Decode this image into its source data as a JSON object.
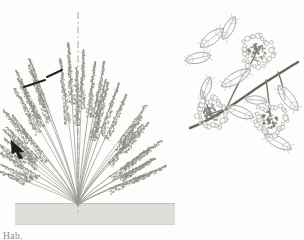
{
  "plate": {
    "background_color": "#fdfdfc",
    "ink_color": "#8a8a86",
    "dark_ink_color": "#23231f",
    "line_color": "#9b9b95",
    "soil_color": "#d8d8d2",
    "caption": "Hab."
  },
  "habit_panel": {
    "name": "plant-habit-illustration",
    "description": "Whole-plant habit drawing of a low shrub with many arching stems bearing dense flowering spikes, rooted at a central crown in a soil band.",
    "axis_line": {
      "label": "vertical-dashed-axis",
      "style": "dash-dot",
      "x": 78,
      "y_top": 12,
      "y_bottom": 214
    },
    "crown": {
      "x": 78,
      "y": 205
    },
    "soil_band": {
      "label": "soil-ground-band",
      "x": 15,
      "y": 203,
      "width": 160,
      "height": 22,
      "fill": "#d8d8d2"
    },
    "markers": [
      {
        "label": "scale-bar-upper",
        "x1": 47,
        "y1": 77,
        "x2": 62,
        "y2": 70
      },
      {
        "label": "scale-bar-lower",
        "x1": 24,
        "y1": 87,
        "x2": 45,
        "y2": 80
      },
      {
        "label": "arrow-pointer",
        "x": 17,
        "y": 146
      }
    ],
    "stem_count": 34,
    "spike_count": 34
  },
  "detail_panel": {
    "name": "flowering-branch-detail",
    "description": "Enlarged detail of a flowering branch with ovate opposite leaves and three dense rounded flower clusters.",
    "branch": {
      "label": "main-branch-stem",
      "start": {
        "x": 14,
        "y": 112
      },
      "end": {
        "x": 112,
        "y": 66
      }
    },
    "flower_clusters": [
      {
        "label": "flower-cluster-upper-right",
        "cx": 75,
        "cy": 52,
        "r": 17
      },
      {
        "label": "flower-cluster-lower-left",
        "cx": 30,
        "cy": 113,
        "r": 16
      },
      {
        "label": "flower-cluster-lower-right",
        "cx": 88,
        "cy": 120,
        "r": 17
      }
    ],
    "leaves": [
      {
        "label": "leaf-upper-left-a",
        "cx": 30,
        "cy": 38
      },
      {
        "label": "leaf-upper-left-b",
        "cx": 18,
        "cy": 57
      },
      {
        "label": "leaf-upper-left-c",
        "cx": 44,
        "cy": 30
      },
      {
        "label": "leaf-mid-center",
        "cx": 52,
        "cy": 76
      },
      {
        "label": "leaf-lower-center",
        "cx": 56,
        "cy": 108
      },
      {
        "label": "leaf-right-upper",
        "cx": 105,
        "cy": 98
      },
      {
        "label": "leaf-right-lower",
        "cx": 96,
        "cy": 140
      }
    ]
  }
}
